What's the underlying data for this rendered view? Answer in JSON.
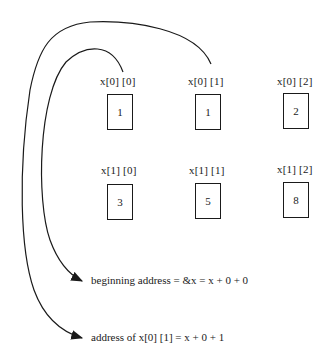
{
  "diagram": {
    "rows": [
      {
        "cells": [
          {
            "label": "x[0] [0]",
            "value": "1"
          },
          {
            "label": "x[0] [1]",
            "value": "1"
          },
          {
            "label": "x[0] [2]",
            "value": "2"
          }
        ]
      },
      {
        "cells": [
          {
            "label": "x[1] [0]",
            "value": "3"
          },
          {
            "label": "x[1] [1]",
            "value": "5"
          },
          {
            "label": "x[1] [2]",
            "value": "8"
          }
        ]
      }
    ],
    "annotations": [
      {
        "text": "beginning  address = &x = x + 0 + 0",
        "points_from": "x[0] [0]"
      },
      {
        "text": "address  of  x[0] [1] = x + 0 + 1",
        "points_from": "x[0] [1]"
      }
    ],
    "colors": {
      "ink": "#1a1a1a",
      "background": "#ffffff"
    }
  }
}
